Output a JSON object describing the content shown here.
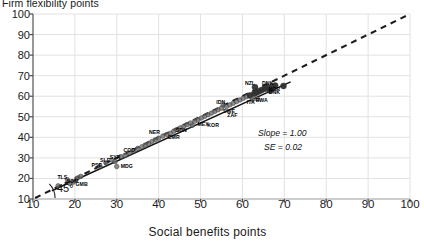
{
  "chart_data": {
    "type": "scatter",
    "title": "",
    "xlabel": "Social benefits points",
    "ylabel": "Firm flexibility points",
    "xlim": [
      10,
      100
    ],
    "ylim": [
      10,
      100
    ],
    "xticks": [
      10,
      20,
      30,
      40,
      50,
      60,
      70,
      80,
      90,
      100
    ],
    "yticks": [
      10,
      20,
      30,
      40,
      50,
      60,
      70,
      80,
      90,
      100
    ],
    "grid": true,
    "legend": "none",
    "annotations": {
      "slope": "Slope = 1.00",
      "se": "SE = 0.02",
      "angle": "45°"
    },
    "reference_line": {
      "style": "dashed",
      "slope": 1.0,
      "intercept": 0,
      "label": "45° line"
    },
    "points": [
      {
        "label": "SSD",
        "x": 16.0,
        "y": 16.4
      },
      {
        "label": "TLS",
        "x": 18.2,
        "y": 19.4
      },
      {
        "label": "GMB",
        "x": 19.6,
        "y": 18.2
      },
      {
        "label": "SOM",
        "x": 18.8,
        "y": 17.6
      },
      {
        "label": "COD",
        "x": 20.6,
        "y": 20.2
      },
      {
        "label": "AFG",
        "x": 21.4,
        "y": 21.0
      },
      {
        "label": "PSE",
        "x": 26.0,
        "y": 26.0
      },
      {
        "label": "SLE",
        "x": 27.4,
        "y": 27.6
      },
      {
        "label": "MDG",
        "x": 30.0,
        "y": 25.8
      },
      {
        "label": "SYR",
        "x": 28.8,
        "y": 29.0
      },
      {
        "label": "HTI",
        "x": 29.6,
        "y": 28.2
      },
      {
        "label": "LBR",
        "x": 31.0,
        "y": 30.6
      },
      {
        "label": "TCD",
        "x": 32.0,
        "y": 31.2
      },
      {
        "label": "NER",
        "x": 33.0,
        "y": 32.4
      },
      {
        "label": "MLI",
        "x": 34.0,
        "y": 33.4
      },
      {
        "label": "BFA",
        "x": 35.0,
        "y": 34.6
      },
      {
        "label": "GIN",
        "x": 36.0,
        "y": 35.4
      },
      {
        "label": "CAF",
        "x": 36.8,
        "y": 36.2
      },
      {
        "label": "YEM",
        "x": 37.6,
        "y": 37.0
      },
      {
        "label": "BDI",
        "x": 38.4,
        "y": 38.0
      },
      {
        "label": "MOZ",
        "x": 39.2,
        "y": 38.8
      },
      {
        "label": "NPL",
        "x": 40.0,
        "y": 39.6
      },
      {
        "label": "BGD",
        "x": 41.0,
        "y": 40.6
      },
      {
        "label": "PAK",
        "x": 42.0,
        "y": 41.4
      },
      {
        "label": "NGA",
        "x": 42.8,
        "y": 42.0
      },
      {
        "label": "ETH",
        "x": 43.6,
        "y": 43.0
      },
      {
        "label": "TZA",
        "x": 44.4,
        "y": 43.8
      },
      {
        "label": "UGA",
        "x": 45.2,
        "y": 44.6
      },
      {
        "label": "KEN",
        "x": 46.0,
        "y": 45.4
      },
      {
        "label": "GHA",
        "x": 46.8,
        "y": 46.2
      },
      {
        "label": "MEX",
        "x": 48.0,
        "y": 45.8
      },
      {
        "label": "ZMB",
        "x": 47.6,
        "y": 47.0
      },
      {
        "label": "IND",
        "x": 48.6,
        "y": 47.8
      },
      {
        "label": "PHL",
        "x": 49.4,
        "y": 48.6
      },
      {
        "label": "VNM",
        "x": 50.2,
        "y": 49.4
      },
      {
        "label": "EGY",
        "x": 51.0,
        "y": 50.2
      },
      {
        "label": "MAR",
        "x": 51.8,
        "y": 51.0
      },
      {
        "label": "COL",
        "x": 52.6,
        "y": 51.8
      },
      {
        "label": "PER",
        "x": 53.4,
        "y": 52.6
      },
      {
        "label": "BRA",
        "x": 54.2,
        "y": 53.4
      },
      {
        "label": "IDN",
        "x": 55.4,
        "y": 55.6
      },
      {
        "label": "ZAF",
        "x": 55.0,
        "y": 54.2
      },
      {
        "label": "THA",
        "x": 56.2,
        "y": 55.0
      },
      {
        "label": "TUR",
        "x": 57.0,
        "y": 55.8
      },
      {
        "label": "CHN",
        "x": 57.8,
        "y": 56.6
      },
      {
        "label": "RUS",
        "x": 58.6,
        "y": 57.4
      },
      {
        "label": "ARG",
        "x": 59.4,
        "y": 58.2
      },
      {
        "label": "CHL",
        "x": 60.2,
        "y": 59.0
      },
      {
        "label": "POL",
        "x": 61.0,
        "y": 59.8
      },
      {
        "label": "GRC",
        "x": 61.8,
        "y": 60.4
      },
      {
        "label": "ITA",
        "x": 62.4,
        "y": 58.4
      },
      {
        "label": "RWA",
        "x": 63.6,
        "y": 58.6
      },
      {
        "label": "ESP",
        "x": 62.8,
        "y": 61.2
      },
      {
        "label": "PRT",
        "x": 63.4,
        "y": 61.8
      },
      {
        "label": "FRA",
        "x": 64.0,
        "y": 62.4
      },
      {
        "label": "DEU",
        "x": 64.6,
        "y": 63.0
      },
      {
        "label": "NZL",
        "x": 63.0,
        "y": 64.4
      },
      {
        "label": "GBR",
        "x": 65.4,
        "y": 63.6
      },
      {
        "label": "SWE",
        "x": 66.0,
        "y": 64.2
      },
      {
        "label": "DNK",
        "x": 66.6,
        "y": 62.8
      },
      {
        "label": "NOR",
        "x": 67.2,
        "y": 64.8
      },
      {
        "label": "USA",
        "x": 67.8,
        "y": 65.2
      },
      {
        "label": "CAN",
        "x": 69.8,
        "y": 65.0
      }
    ],
    "visible_point_labels": [
      {
        "text": "TLS",
        "x": 17.0,
        "y": 20.6
      },
      {
        "text": "GMB",
        "x": 21.6,
        "y": 17.4
      },
      {
        "text": "SOM",
        "x": 19.4,
        "y": 18.8
      },
      {
        "text": "PSE",
        "x": 25.2,
        "y": 26.6
      },
      {
        "text": "SLE",
        "x": 27.2,
        "y": 29.0
      },
      {
        "text": "MDG",
        "x": 32.4,
        "y": 26.0
      },
      {
        "text": "SYR",
        "x": 29.6,
        "y": 30.4
      },
      {
        "text": "COD",
        "x": 33.0,
        "y": 33.6
      },
      {
        "text": "NER",
        "x": 39.0,
        "y": 42.6
      },
      {
        "text": "MEX",
        "x": 50.6,
        "y": 46.4
      },
      {
        "text": "CMR",
        "x": 43.6,
        "y": 40.0
      },
      {
        "text": "SDN",
        "x": 45.4,
        "y": 43.6
      },
      {
        "text": "KOR",
        "x": 53.0,
        "y": 45.8
      },
      {
        "text": "IDN",
        "x": 54.8,
        "y": 57.2
      },
      {
        "text": "SWE",
        "x": 56.8,
        "y": 53.0
      },
      {
        "text": "ZAF",
        "x": 57.6,
        "y": 51.0
      },
      {
        "text": "NZL",
        "x": 61.8,
        "y": 66.4
      },
      {
        "text": "DNK",
        "x": 66.0,
        "y": 66.2
      },
      {
        "text": "NOR",
        "x": 67.6,
        "y": 63.4
      },
      {
        "text": "DNK",
        "x": 67.6,
        "y": 62.0
      },
      {
        "text": "RWA",
        "x": 64.6,
        "y": 58.4
      },
      {
        "text": "ITA",
        "x": 62.0,
        "y": 57.0
      }
    ]
  },
  "axes": {
    "y_title": "Firm flexibility points",
    "x_title": "Social benefits points"
  }
}
